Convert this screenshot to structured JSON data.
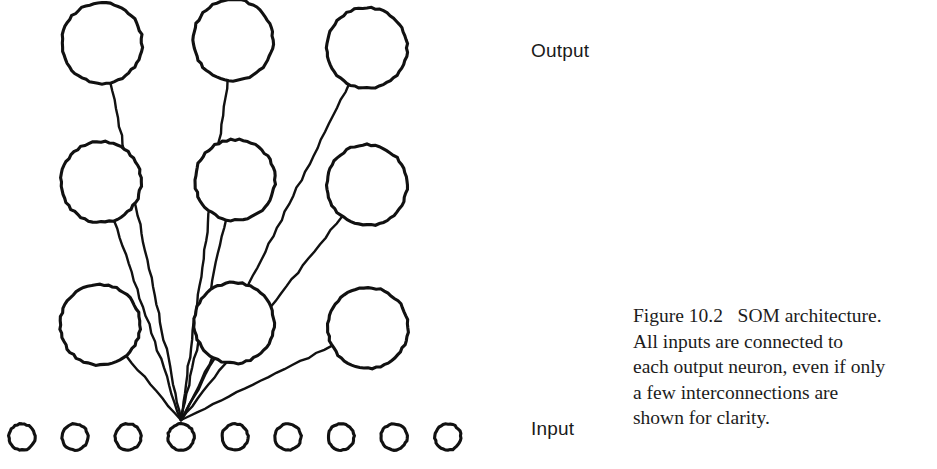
{
  "figure": {
    "labels": {
      "output": "Output",
      "input": "Input"
    },
    "caption_lines": [
      "Figure 10.2   SOM architecture.",
      "All inputs are connected to",
      "each output neuron, even if only",
      "a few interconnections are",
      "shown for clarity."
    ],
    "caption_full": "Figure 10.2   SOM architecture. All inputs are connected to each output neuron, even if only a few interconnections are shown for clarity."
  },
  "colors": {
    "stroke": "#111111",
    "background": "#ffffff",
    "text": "#1a1a1a"
  },
  "diagram_data": {
    "type": "diagram",
    "description": "Self-Organizing Map (SOM) architecture: a 3x3 grid of large output neurons above a row of 9 small input neurons, with connection lines drawn from the 4th input neuron to each output neuron.",
    "output_layer": {
      "rows": 3,
      "cols": 3,
      "node_radius": 40,
      "nodes": [
        {
          "id": "out-r1c1",
          "cx": 102,
          "cy": 43,
          "row": 1,
          "col": 1
        },
        {
          "id": "out-r1c2",
          "cx": 233,
          "cy": 40,
          "row": 1,
          "col": 2
        },
        {
          "id": "out-r1c3",
          "cx": 367,
          "cy": 48,
          "row": 1,
          "col": 3
        },
        {
          "id": "out-r2c1",
          "cx": 101,
          "cy": 182,
          "row": 2,
          "col": 1
        },
        {
          "id": "out-r2c2",
          "cx": 235,
          "cy": 180,
          "row": 2,
          "col": 2
        },
        {
          "id": "out-r2c3",
          "cx": 367,
          "cy": 185,
          "row": 2,
          "col": 3
        },
        {
          "id": "out-r3c1",
          "cx": 100,
          "cy": 325,
          "row": 3,
          "col": 1
        },
        {
          "id": "out-r3c2",
          "cx": 234,
          "cy": 323,
          "row": 3,
          "col": 2
        },
        {
          "id": "out-r3c3",
          "cx": 368,
          "cy": 328,
          "row": 3,
          "col": 3
        }
      ]
    },
    "input_layer": {
      "count": 9,
      "node_radius": 13,
      "cy": 437,
      "connected_index": 4,
      "nodes": [
        {
          "id": "in-1",
          "cx": 22,
          "cy": 437
        },
        {
          "id": "in-2",
          "cx": 75,
          "cy": 437
        },
        {
          "id": "in-3",
          "cx": 128,
          "cy": 437
        },
        {
          "id": "in-4",
          "cx": 181,
          "cy": 437
        },
        {
          "id": "in-5",
          "cx": 235,
          "cy": 437
        },
        {
          "id": "in-6",
          "cx": 288,
          "cy": 437
        },
        {
          "id": "in-7",
          "cx": 341,
          "cy": 437
        },
        {
          "id": "in-8",
          "cx": 394,
          "cy": 437
        },
        {
          "id": "in-9",
          "cx": 448,
          "cy": 437
        }
      ]
    },
    "connections": {
      "hub": {
        "x": 181,
        "y": 420
      },
      "count": 9,
      "edges": [
        {
          "from": "in-4",
          "to": "out-r1c1"
        },
        {
          "from": "in-4",
          "to": "out-r1c2"
        },
        {
          "from": "in-4",
          "to": "out-r1c3"
        },
        {
          "from": "in-4",
          "to": "out-r2c1"
        },
        {
          "from": "in-4",
          "to": "out-r2c2"
        },
        {
          "from": "in-4",
          "to": "out-r2c3"
        },
        {
          "from": "in-4",
          "to": "out-r3c1"
        },
        {
          "from": "in-4",
          "to": "out-r3c2"
        },
        {
          "from": "in-4",
          "to": "out-r3c3"
        }
      ]
    }
  }
}
